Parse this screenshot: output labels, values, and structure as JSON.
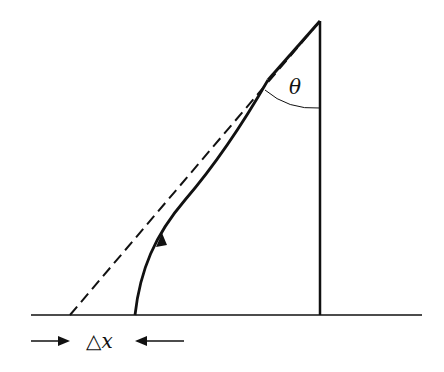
{
  "diagram": {
    "angle_label": "θ",
    "displacement_label": "△x",
    "colors": {
      "line": "#111111",
      "background": "#ffffff"
    },
    "elements": [
      "ground-line",
      "vertical-line",
      "dashed-straight-line",
      "curved-path-with-arrow",
      "angle-arc",
      "displacement-arrows"
    ]
  }
}
